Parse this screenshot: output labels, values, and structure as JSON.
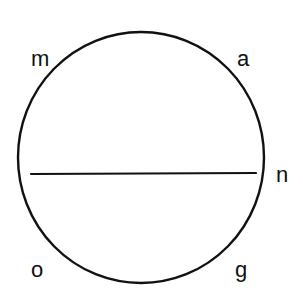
{
  "diagram": {
    "type": "circle-with-chord",
    "background": "#ffffff",
    "stroke_color": "#111111",
    "circle": {
      "cx": 141,
      "cy": 157.5,
      "rx": 123,
      "ry": 125.5,
      "stroke_width": 2.4
    },
    "chord": {
      "x1": 31,
      "y1": 174,
      "x2": 256,
      "y2": 173,
      "stroke_width": 2.2
    },
    "labels": [
      {
        "id": "m",
        "text": "m",
        "x": 31,
        "y": 66
      },
      {
        "id": "a",
        "text": "a",
        "x": 237,
        "y": 66
      },
      {
        "id": "n",
        "text": "n",
        "x": 276,
        "y": 182
      },
      {
        "id": "o",
        "text": "o",
        "x": 31,
        "y": 277
      },
      {
        "id": "g",
        "text": "g",
        "x": 235,
        "y": 277
      }
    ]
  }
}
